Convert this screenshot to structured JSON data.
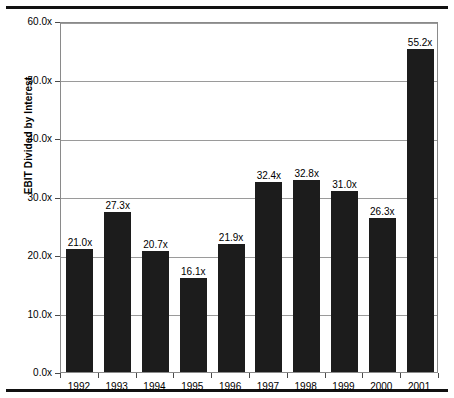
{
  "chart_data": {
    "type": "bar",
    "title": "",
    "xlabel": "",
    "ylabel": "EBIT Divided by Interest",
    "categories": [
      "1992",
      "1993",
      "1994",
      "1995",
      "1996",
      "1997",
      "1998",
      "1999",
      "2000",
      "2001"
    ],
    "values": [
      21.0,
      27.3,
      20.7,
      16.1,
      21.9,
      32.4,
      32.8,
      31.0,
      26.3,
      55.2
    ],
    "data_labels": [
      "21.0x",
      "27.3x",
      "20.7x",
      "16.1x",
      "21.9x",
      "32.4x",
      "32.8x",
      "31.0x",
      "26.3x",
      "55.2x"
    ],
    "ylim": [
      0,
      60
    ],
    "ytick_values": [
      0,
      10,
      20,
      30,
      40,
      50,
      60
    ],
    "ytick_labels": [
      "0.0x",
      "10.0x",
      "20.0x",
      "30.0x",
      "40.0x",
      "50.0x",
      "60.0x"
    ],
    "grid": true,
    "legend": false,
    "legend_position": "none",
    "bar_color": "#1c1c1c",
    "gridline_color": "#9a9a9a",
    "background_color": "#ffffff"
  }
}
